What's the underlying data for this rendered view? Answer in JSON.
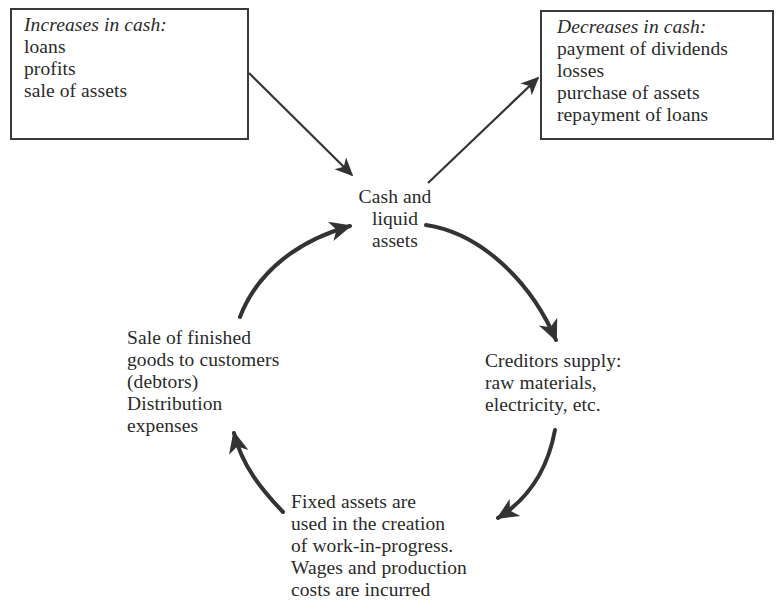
{
  "diagram": {
    "increases_box": {
      "heading": "Increases in cash:",
      "items": [
        "loans",
        "profits",
        "sale of assets"
      ]
    },
    "decreases_box": {
      "heading": "Decreases in cash:",
      "items": [
        "payment of dividends",
        "losses",
        "purchase of assets",
        "repayment of loans"
      ]
    },
    "cycle_nodes": {
      "cash": {
        "lines": [
          "Cash and",
          "liquid",
          "assets"
        ]
      },
      "creditors": {
        "lines": [
          "Creditors supply:",
          "raw materials,",
          "electricity, etc."
        ]
      },
      "production": {
        "lines": [
          "Fixed assets are",
          "used in the creation",
          "of work-in-progress.",
          "Wages and production",
          "costs are incurred"
        ]
      },
      "sales": {
        "lines": [
          "Sale of finished",
          "goods to customers",
          "(debtors)",
          "Distribution",
          "expenses"
        ]
      }
    },
    "edges": [
      {
        "from": "increases_box",
        "to": "cash",
        "style": "straight"
      },
      {
        "from": "cash",
        "to": "decreases_box",
        "style": "straight"
      },
      {
        "from": "cash",
        "to": "creditors",
        "style": "curved"
      },
      {
        "from": "creditors",
        "to": "production",
        "style": "curved"
      },
      {
        "from": "production",
        "to": "sales",
        "style": "curved"
      },
      {
        "from": "sales",
        "to": "cash",
        "style": "curved"
      }
    ],
    "colors": {
      "ink": "#2a2a2a",
      "arrow": "#333333",
      "background": "#ffffff"
    }
  }
}
